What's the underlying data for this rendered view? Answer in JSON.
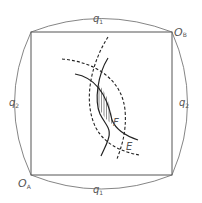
{
  "diagram": {
    "labels": {
      "q1_top": "q",
      "q1_top_sub": "1",
      "q1_bottom": "q",
      "q1_bottom_sub": "1",
      "q2_left": "q",
      "q2_left_sub": "2",
      "q2_right": "q",
      "q2_right_sub": "2",
      "origin_a": "O",
      "origin_a_sub": "A",
      "origin_b": "O",
      "origin_b_sub": "B",
      "point_f": "F",
      "point_e": "E"
    },
    "colors": {
      "frame": "#555555",
      "curves": "#222222",
      "text": "#555555"
    }
  }
}
